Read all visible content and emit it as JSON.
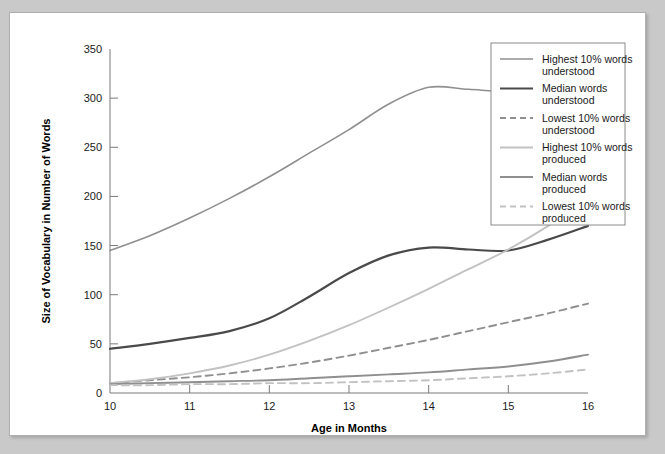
{
  "figure": {
    "background_color": "#ffffff",
    "page_color": "#c9c9c9",
    "border_color": "#b0b0b0"
  },
  "chart_data": {
    "type": "line",
    "title": "",
    "xlabel": "Age in Months",
    "ylabel": "Size of Vocabulary in Number of Words",
    "xlim": [
      10,
      16
    ],
    "ylim": [
      0,
      350
    ],
    "xticks": [
      10,
      11,
      12,
      13,
      14,
      15,
      16
    ],
    "xtick_labels": [
      "10",
      "11",
      "12",
      "13",
      "14",
      "15",
      "16"
    ],
    "yticks": [
      0,
      50,
      100,
      150,
      200,
      250,
      300,
      350
    ],
    "ytick_labels": [
      "0",
      "50",
      "100",
      "150",
      "200",
      "250",
      "300",
      "350"
    ],
    "grid": false,
    "legend_position": "right-outside",
    "x": [
      10,
      10.5,
      11,
      11.5,
      12,
      12.5,
      13,
      13.5,
      14,
      14.5,
      15,
      15.5,
      16
    ],
    "series": [
      {
        "name": "Highest 10% words understood",
        "label_line1": "Highest 10% words",
        "label_line2": "understood",
        "color": "#8f8f8f",
        "width": 1.6,
        "dash": "none",
        "values": [
          145,
          160,
          178,
          198,
          220,
          244,
          268,
          294,
          311,
          309,
          307,
          312,
          320
        ]
      },
      {
        "name": "Median words understood",
        "label_line1": "Median words",
        "label_line2": "understood",
        "color": "#4a4a4a",
        "width": 2.2,
        "dash": "none",
        "values": [
          45,
          50,
          56,
          63,
          76,
          98,
          122,
          140,
          148,
          146,
          145,
          156,
          170
        ]
      },
      {
        "name": "Lowest 10% words understood",
        "label_line1": "Lowest 10% words",
        "label_line2": "understood",
        "color": "#8f8f8f",
        "width": 1.9,
        "dash": "7,5",
        "values": [
          10,
          13,
          16,
          20,
          25,
          31,
          38,
          46,
          54,
          63,
          72,
          81,
          91
        ]
      },
      {
        "name": "Highest 10% words produced",
        "label_line1": "Highest 10% words",
        "label_line2": "produced",
        "color": "#c2c2c2",
        "width": 1.9,
        "dash": "none",
        "values": [
          10,
          14,
          20,
          28,
          39,
          53,
          69,
          87,
          106,
          126,
          146,
          170,
          198
        ]
      },
      {
        "name": "Median words produced",
        "label_line1": "Median words",
        "label_line2": "produced",
        "color": "#8f8f8f",
        "width": 1.9,
        "dash": "none",
        "values": [
          9,
          10,
          11,
          12,
          13,
          15,
          17,
          19,
          21,
          24,
          27,
          32,
          39
        ]
      },
      {
        "name": "Lowest 10% words produced",
        "label_line1": "Lowest 10% words",
        "label_line2": "produced",
        "color": "#c2c2c2",
        "width": 1.9,
        "dash": "7,5",
        "values": [
          8,
          8,
          9,
          9,
          10,
          10,
          11,
          12,
          13,
          15,
          17,
          20,
          24
        ]
      }
    ]
  }
}
